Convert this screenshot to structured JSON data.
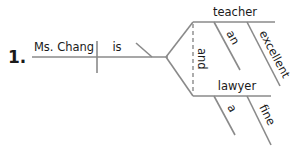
{
  "diagram": {
    "type": "sentence-diagram",
    "item_number": "1.",
    "subject": "Ms. Chang",
    "verb": "is",
    "complement_conjunction": "and",
    "complements": [
      {
        "word": "teacher",
        "modifiers": [
          "an",
          "excellent"
        ]
      },
      {
        "word": "lawyer",
        "modifiers": [
          "a",
          "fine"
        ]
      }
    ],
    "line_color": "#8a8a8a",
    "text_color": "#1a1a1a"
  }
}
